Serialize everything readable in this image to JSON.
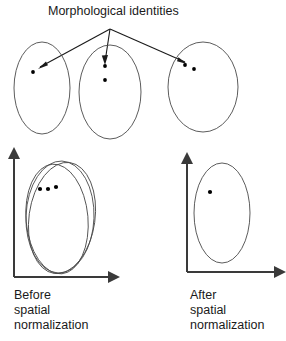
{
  "figure": {
    "title": "Morphological identities",
    "caption_left": [
      "Before",
      "spatial",
      "normalization"
    ],
    "caption_right": [
      "After",
      "spatial",
      "normalization"
    ],
    "colors": {
      "ellipse_stroke": "#4a4a4a",
      "axis": "#3a3a3a",
      "arrow": "#1a1a1a",
      "dot": "#000000",
      "text": "#1a1a1a",
      "background": "#ffffff"
    }
  },
  "top_row": {
    "description": "Three individual subject brain spaces, each an ellipse containing morphological identity points",
    "arrow_origin": {
      "x": 110,
      "y": 29
    },
    "ellipses": [
      {
        "id": "subject-1",
        "cx": 42,
        "cy": 88,
        "rx": 28,
        "ry": 46,
        "dots": [
          {
            "x": 33,
            "y": 72
          }
        ],
        "arrow_tip": {
          "x": 38,
          "y": 69
        }
      },
      {
        "id": "subject-2",
        "cx": 110,
        "cy": 92,
        "rx": 31,
        "ry": 47,
        "dots": [
          {
            "x": 105,
            "y": 66
          },
          {
            "x": 105,
            "y": 80
          }
        ],
        "arrow_tip": {
          "x": 105,
          "y": 64
        }
      },
      {
        "id": "subject-3",
        "cx": 203,
        "cy": 87,
        "rx": 35,
        "ry": 45,
        "dots": [
          {
            "x": 185,
            "y": 65
          },
          {
            "x": 194,
            "y": 69
          }
        ],
        "arrow_tip": {
          "x": 183,
          "y": 63
        }
      }
    ]
  },
  "plot_before": {
    "label": "Before spatial normalization",
    "axes": {
      "origin_x": 14,
      "origin_y": 277,
      "top_y": 155,
      "right_x": 112
    },
    "ellipses": [
      {
        "cx": 62,
        "cy": 218,
        "rx": 33,
        "ry": 56,
        "rotation": 8
      },
      {
        "cx": 60,
        "cy": 217,
        "rx": 34,
        "ry": 56,
        "rotation": 2
      },
      {
        "cx": 57,
        "cy": 219,
        "rx": 31,
        "ry": 55,
        "rotation": -5
      }
    ],
    "dots": [
      {
        "x": 40,
        "y": 189
      },
      {
        "x": 48,
        "y": 189
      },
      {
        "x": 56,
        "y": 187
      }
    ]
  },
  "plot_after": {
    "label": "After spatial normalization",
    "axes": {
      "origin_x": 187,
      "origin_y": 272,
      "top_y": 160,
      "right_x": 278
    },
    "ellipses": [
      {
        "cx": 222,
        "cy": 213,
        "rx": 28,
        "ry": 50,
        "rotation": 0
      }
    ],
    "dots": [
      {
        "x": 210,
        "y": 192
      }
    ]
  }
}
